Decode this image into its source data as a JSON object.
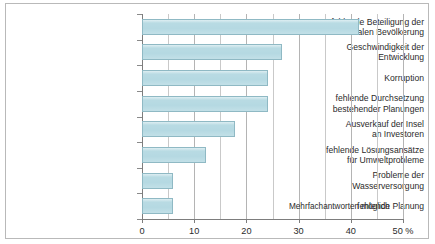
{
  "chart_data": {
    "type": "bar",
    "orientation": "horizontal",
    "title": "",
    "subtitle": "",
    "xlabel": "",
    "ylabel": "",
    "xlim": [
      0,
      50
    ],
    "xtick_labels": [
      "0",
      "10",
      "20",
      "30",
      "40",
      "50 %"
    ],
    "xticks": [
      0,
      10,
      20,
      30,
      40,
      50
    ],
    "xtick_step": 10,
    "minor_gridline_step": 5,
    "grid": true,
    "legend": null,
    "annotation": "Mehrfachantworten möglich",
    "bar_color": "#b5d9e2",
    "bar_border_color": "#8fb9c4",
    "grid_color": "#c9c9c9",
    "axis_color": "#7d7d7d",
    "categories": [
      "fehlende Beteiligung der\nlokalen Bevölkerung",
      "Geschwindigkeit der\nEntwicklung",
      "Korruption",
      "fehlende Durchsetzung\nbestehender Planungen",
      "Ausverkauf der Insel\nan Investoren",
      "fehlende Lösungsansätze\nfür Umweltprobleme",
      "Probleme der\nWasserversorgung",
      "fehlende Planung"
    ],
    "values": [
      41.5,
      26.8,
      24.1,
      24.1,
      17.8,
      12.3,
      6.0,
      6.0
    ],
    "unit": "%"
  }
}
